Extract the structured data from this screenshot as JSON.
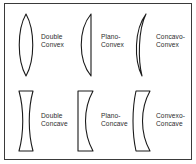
{
  "figure": {
    "border_color": "#3a3a3a",
    "background_color": "#ffffff",
    "stroke_color": "#1a1a1a",
    "text_color": "#2b2b2b"
  },
  "lenses": [
    {
      "id": "double-convex",
      "shape": "biconvex",
      "label_line1": "Double",
      "label_line2": "Convex",
      "row": 1,
      "column": 1
    },
    {
      "id": "plano-convex",
      "shape": "plano-convex",
      "label_line1": "Plano-",
      "label_line2": "Convex",
      "row": 1,
      "column": 2
    },
    {
      "id": "concavo-convex",
      "shape": "meniscus-converging",
      "label_line1": "Concavo-",
      "label_line2": "Convex",
      "row": 1,
      "column": 3
    },
    {
      "id": "double-concave",
      "shape": "biconcave",
      "label_line1": "Double",
      "label_line2": "Concave",
      "row": 2,
      "column": 1
    },
    {
      "id": "plano-concave",
      "shape": "plano-concave",
      "label_line1": "Plano-",
      "label_line2": "Concave",
      "row": 2,
      "column": 2
    },
    {
      "id": "convexo-concave",
      "shape": "meniscus-diverging",
      "label_line1": "Convexo-",
      "label_line2": "Concave",
      "row": 2,
      "column": 3
    }
  ]
}
